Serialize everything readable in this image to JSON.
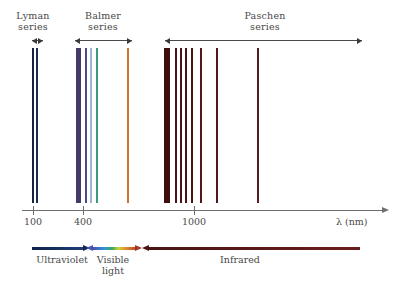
{
  "figure": {
    "background": "#ffffff"
  },
  "series_labels": [
    {
      "name": "lyman",
      "text": "Lyman\nseries",
      "left": 6,
      "top": 10,
      "width": 54
    },
    {
      "name": "balmer",
      "text": "Balmer\nseries",
      "left": 76,
      "top": 10,
      "width": 54
    },
    {
      "name": "paschen",
      "text": "Paschen\nseries",
      "left": 235,
      "top": 10,
      "width": 60
    }
  ],
  "range_bars": [
    {
      "name": "lyman-range",
      "left": 32,
      "width": 11,
      "top": 37,
      "heads": "both"
    },
    {
      "name": "balmer-range",
      "left": 75,
      "width": 57,
      "top": 37,
      "heads": "both"
    },
    {
      "name": "paschen-range",
      "left": 165,
      "width": 197,
      "top": 37,
      "heads": "both"
    }
  ],
  "axis": {
    "label": "λ (nm)",
    "ticks": [
      {
        "value": "100",
        "x": 33
      },
      {
        "value": "400",
        "x": 83
      },
      {
        "value": "1000",
        "x": 194
      }
    ]
  },
  "bands": [
    {
      "name": "ultraviolet",
      "label": "Ultraviolet",
      "label_left": 22,
      "label_top": 254,
      "label_width": 80,
      "shaft_left": 32,
      "shaft_width": 52,
      "top": 245,
      "arrow": "right",
      "color_start": "#10204a",
      "color_end": "#1d3f7a",
      "head_color": "#14284f"
    },
    {
      "name": "visible-light",
      "label": "Visible\nlight",
      "label_left": 86,
      "label_top": 254,
      "label_width": 54,
      "shaft_left": 92,
      "shaft_width": 44,
      "top": 245,
      "arrow": "both",
      "gradient": "linear-gradient(to right, #5b3fa0 0%, #3f6fc4 14%, #2f9ad1 30%, #3aa85a 46%, #cfcf3a 60%, #e08a2e 78%, #c0442a 100%)",
      "head_color_left": "#4558b5",
      "head_color_right": "#9e3a24"
    },
    {
      "name": "infrared",
      "label": "Infrared",
      "label_left": 200,
      "label_top": 254,
      "label_width": 80,
      "shaft_left": 148,
      "shaft_width": 212,
      "top": 245,
      "arrow": "left",
      "color_start": "#4a1414",
      "color_end": "#6b1d1d",
      "head_color": "#4a1414"
    }
  ],
  "chart_data": {
    "type": "bar",
    "xlabel": "λ (nm)",
    "ylabel": "",
    "xscale": "log",
    "xticks": [
      100,
      400,
      1000
    ],
    "grid": false,
    "legend": "none",
    "series": [
      {
        "name": "Lyman series",
        "range_nm": [
          91,
          122
        ],
        "color": "#1b2a4a",
        "lines": [
          {
            "label": "Ly-limit",
            "x_px": 33,
            "width_px": 2.2,
            "color": "#16243f"
          },
          {
            "label": "Ly-alpha",
            "x_px": 37,
            "width_px": 2.2,
            "color": "#1c2c4f"
          }
        ]
      },
      {
        "name": "Balmer series",
        "range_nm": [
          365,
          656
        ],
        "color": "#5a4a86",
        "lines": [
          {
            "label": "Balmer-limit",
            "x_px": 78,
            "width_px": 5.0,
            "color": "#453a6a"
          },
          {
            "label": "H-delta",
            "x_px": 86,
            "width_px": 2.0,
            "color": "#4c4a86"
          },
          {
            "label": "H-beta",
            "x_px": 91,
            "width_px": 2.0,
            "color": "#9fb4d8"
          },
          {
            "label": "H-green",
            "x_px": 97,
            "width_px": 2.2,
            "color": "#3f9a76"
          },
          {
            "label": "H-alpha",
            "x_px": 128,
            "width_px": 2.2,
            "color": "#d4722e"
          }
        ]
      },
      {
        "name": "Paschen series",
        "range_nm": [
          820,
          1875
        ],
        "color": "#4a1414",
        "lines": [
          {
            "label": "Pa-limit",
            "x_px": 167,
            "width_px": 6.0,
            "color": "#3d0e0e"
          },
          {
            "label": "Pa-h",
            "x_px": 176,
            "width_px": 2.4,
            "color": "#4a1414"
          },
          {
            "label": "Pa-g",
            "x_px": 181,
            "width_px": 2.4,
            "color": "#4a1414"
          },
          {
            "label": "Pa-f",
            "x_px": 186,
            "width_px": 2.2,
            "color": "#4a1414"
          },
          {
            "label": "Pa-epsilon",
            "x_px": 192,
            "width_px": 2.0,
            "color": "#4a1414"
          },
          {
            "label": "Pa-delta",
            "x_px": 201,
            "width_px": 2.0,
            "color": "#501818"
          },
          {
            "label": "Pa-beta",
            "x_px": 217,
            "width_px": 2.0,
            "color": "#501818"
          },
          {
            "label": "Pa-alpha",
            "x_px": 258,
            "width_px": 2.0,
            "color": "#5a1c1c"
          }
        ]
      }
    ],
    "annotations": [
      {
        "text": "Lyman series",
        "region": "ultraviolet"
      },
      {
        "text": "Balmer series",
        "region": "visible"
      },
      {
        "text": "Paschen series",
        "region": "infrared"
      },
      {
        "text": "Ultraviolet",
        "region": "band"
      },
      {
        "text": "Visible light",
        "region": "band"
      },
      {
        "text": "Infrared",
        "region": "band"
      }
    ]
  }
}
